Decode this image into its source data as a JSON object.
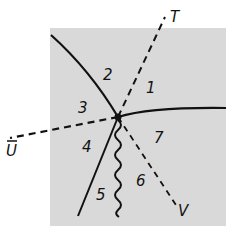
{
  "diagram": {
    "background_color": "#d9d9d9",
    "line_color": "#111111",
    "junction": {
      "x": 118,
      "y": 117
    },
    "axes": [
      {
        "id": "T",
        "label": "T",
        "style": "dashed"
      },
      {
        "id": "U",
        "label": "U",
        "style": "dashed"
      },
      {
        "id": "V",
        "label": "V",
        "style": "dashed"
      }
    ],
    "regions": [
      {
        "id": "1",
        "label": "1"
      },
      {
        "id": "2",
        "label": "2"
      },
      {
        "id": "3",
        "label": "3"
      },
      {
        "id": "4",
        "label": "4"
      },
      {
        "id": "5",
        "label": "5"
      },
      {
        "id": "6",
        "label": "6"
      },
      {
        "id": "7",
        "label": "7"
      }
    ],
    "boundaries": [
      {
        "id": "boundary-upper-left",
        "style": "solid-curve"
      },
      {
        "id": "boundary-right",
        "style": "solid-curve"
      },
      {
        "id": "boundary-lower-left",
        "style": "solid"
      },
      {
        "id": "boundary-lower",
        "style": "wavy"
      }
    ]
  }
}
